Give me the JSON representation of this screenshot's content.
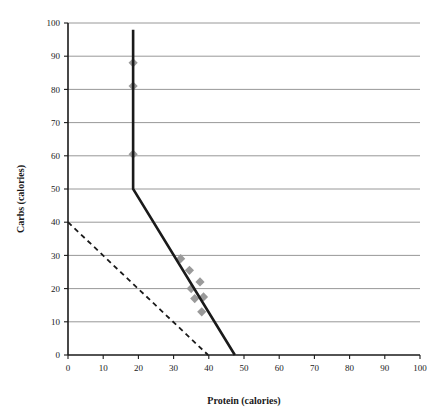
{
  "chart_data": {
    "type": "scatter",
    "title": "",
    "xlabel": "Protein (calories)",
    "ylabel": "Carbs (calories)",
    "xlim": [
      0,
      100
    ],
    "ylim": [
      0,
      100
    ],
    "xticks": [
      0,
      10,
      20,
      30,
      40,
      50,
      60,
      70,
      80,
      90,
      100
    ],
    "yticks": [
      0,
      10,
      20,
      30,
      40,
      50,
      60,
      70,
      80,
      90,
      100
    ],
    "grid": "horizontal",
    "legend": "none",
    "marker_color": "#9a9a9a",
    "line_color": "#1a1a1a",
    "gridline_color": "#8c8c8c",
    "axis_color": "#1a1a1a",
    "series": [
      {
        "name": "data points",
        "type": "scatter",
        "marker": "diamond",
        "color": "#9a9a9a",
        "points": [
          {
            "x": 18.5,
            "y": 88.0
          },
          {
            "x": 18.5,
            "y": 81.0
          },
          {
            "x": 18.5,
            "y": 60.5
          },
          {
            "x": 32.0,
            "y": 29.0
          },
          {
            "x": 34.5,
            "y": 25.5
          },
          {
            "x": 35.0,
            "y": 20.0
          },
          {
            "x": 36.0,
            "y": 17.0
          },
          {
            "x": 37.5,
            "y": 22.0
          },
          {
            "x": 38.0,
            "y": 13.0
          },
          {
            "x": 38.5,
            "y": 17.5
          }
        ]
      },
      {
        "name": "solid boundary",
        "type": "line",
        "style": "solid",
        "color": "#1a1a1a",
        "points": [
          {
            "x": 18.5,
            "y": 98.0
          },
          {
            "x": 18.5,
            "y": 50.0
          },
          {
            "x": 47.4,
            "y": 0.0
          }
        ]
      },
      {
        "name": "dashed boundary",
        "type": "line",
        "style": "dashed",
        "color": "#1a1a1a",
        "points": [
          {
            "x": 0.0,
            "y": 40.0
          },
          {
            "x": 39.8,
            "y": 0.0
          }
        ]
      }
    ]
  },
  "axes": {
    "x_tick_labels": [
      "0",
      "10",
      "20",
      "30",
      "40",
      "50",
      "60",
      "70",
      "80",
      "90",
      "100"
    ],
    "y_tick_labels": [
      "0",
      "10",
      "20",
      "30",
      "40",
      "50",
      "60",
      "70",
      "80",
      "90",
      "100"
    ],
    "x_title": "Protein (calories)",
    "y_title": "Carbs (calories)"
  }
}
